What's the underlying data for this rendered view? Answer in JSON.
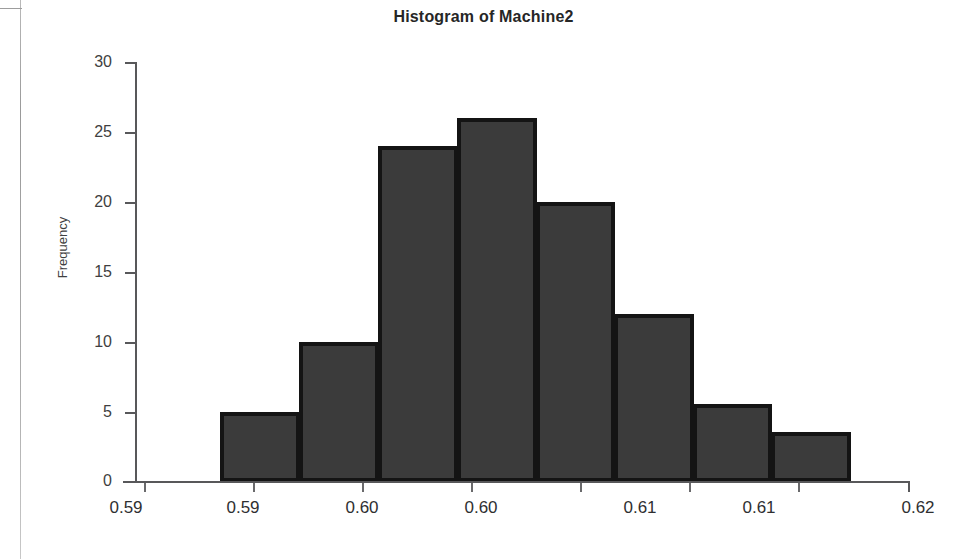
{
  "chart_data": {
    "type": "bar",
    "title": "Histogram of Machine2",
    "xlabel": "",
    "ylabel": "Frequency",
    "ylim": [
      0,
      30
    ],
    "yticks": [
      0,
      5,
      10,
      15,
      20,
      25,
      30
    ],
    "xtick_labels": [
      "0.59",
      "0.59",
      "0.60",
      "0.60",
      "0.61",
      "0.61",
      "0.62"
    ],
    "grid": false,
    "legend": null,
    "bar_fill_color": "#3b3b3b",
    "bar_edge_color": "#141414",
    "categories": [
      "bin1",
      "bin2",
      "bin3",
      "bin4",
      "bin5",
      "bin6",
      "bin7",
      "bin8"
    ],
    "values": [
      5,
      10,
      24,
      26,
      20,
      12,
      5.6,
      3.6
    ]
  },
  "chart": {
    "title": "Histogram of Machine2",
    "y_axis": {
      "title": "Frequency",
      "ticks": [
        {
          "label": "30",
          "value": 30
        },
        {
          "label": "25",
          "value": 25
        },
        {
          "label": "20",
          "value": 20
        },
        {
          "label": "15",
          "value": 15
        },
        {
          "label": "10",
          "value": 10
        },
        {
          "label": "5",
          "value": 5
        },
        {
          "label": "0",
          "value": 0
        }
      ]
    },
    "x_axis": {
      "ticks": [
        {
          "label": "0.59"
        },
        {
          "label": "0.59"
        },
        {
          "label": "0.60"
        },
        {
          "label": "0.60"
        },
        {
          "label": "0.61"
        },
        {
          "label": "0.61"
        },
        {
          "label": "0.62"
        }
      ]
    },
    "bars": [
      {
        "name": "bar-1",
        "value": 5
      },
      {
        "name": "bar-2",
        "value": 10
      },
      {
        "name": "bar-3",
        "value": 24
      },
      {
        "name": "bar-4",
        "value": 26
      },
      {
        "name": "bar-5",
        "value": 20
      },
      {
        "name": "bar-6",
        "value": 12
      },
      {
        "name": "bar-7",
        "value": 5.6
      },
      {
        "name": "bar-8",
        "value": 3.6
      }
    ]
  }
}
